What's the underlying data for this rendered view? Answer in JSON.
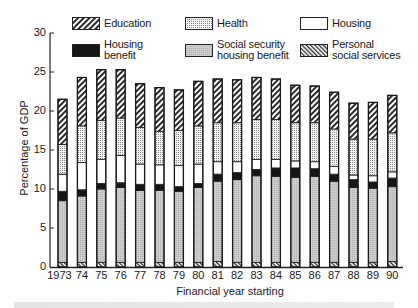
{
  "chart_data": {
    "type": "bar",
    "stacked": true,
    "title": "",
    "xlabel": "Financial year starting",
    "ylabel": "Percentage of GDP",
    "ylim": [
      0,
      30
    ],
    "yticks": [
      0,
      5,
      10,
      15,
      20,
      25,
      30
    ],
    "grid": false,
    "legend_position": "top",
    "categories": [
      "1973",
      "74",
      "75",
      "76",
      "77",
      "78",
      "79",
      "80",
      "81",
      "82",
      "83",
      "84",
      "85",
      "86",
      "87",
      "88",
      "89",
      "90"
    ],
    "series": [
      {
        "name": "Personal social services",
        "pattern": "diag-hatch-right",
        "values": [
          0.6,
          0.6,
          0.6,
          0.6,
          0.6,
          0.6,
          0.6,
          0.6,
          0.7,
          0.6,
          0.6,
          0.6,
          0.6,
          0.6,
          0.6,
          0.6,
          0.6,
          0.7
        ]
      },
      {
        "name": "Social security housing benefit",
        "pattern": "light-gray-stipple",
        "values": [
          7.9,
          8.5,
          9.4,
          9.6,
          9.2,
          9.2,
          9.1,
          9.6,
          10.3,
          10.6,
          11.1,
          11.0,
          10.9,
          11.0,
          10.4,
          9.6,
          9.5,
          9.6
        ]
      },
      {
        "name": "Housing benefit",
        "pattern": "solid-black",
        "values": [
          1.2,
          0.8,
          0.7,
          0.6,
          0.8,
          0.8,
          0.6,
          0.5,
          0.9,
          0.9,
          0.8,
          1.1,
          1.2,
          1.0,
          0.9,
          1.0,
          0.8,
          1.1
        ]
      },
      {
        "name": "Housing",
        "pattern": "white",
        "values": [
          2.2,
          3.5,
          3.1,
          3.5,
          2.6,
          2.5,
          2.7,
          2.5,
          1.6,
          1.4,
          1.3,
          1.1,
          0.9,
          0.9,
          1.0,
          0.6,
          0.8,
          0.8
        ]
      },
      {
        "name": "Health",
        "pattern": "grid-dots",
        "values": [
          3.8,
          4.7,
          5.0,
          4.8,
          4.7,
          4.3,
          4.5,
          4.9,
          5.0,
          5.0,
          5.1,
          5.1,
          4.9,
          5.0,
          4.8,
          4.6,
          4.7,
          5.0
        ]
      },
      {
        "name": "Education",
        "pattern": "diag-hatch-left",
        "values": [
          5.8,
          6.2,
          6.5,
          6.2,
          5.6,
          5.6,
          5.2,
          5.7,
          5.6,
          5.5,
          5.4,
          5.2,
          4.8,
          4.7,
          4.7,
          4.6,
          4.7,
          4.8
        ]
      }
    ],
    "totals": [
      21.5,
      24.3,
      25.3,
      25.3,
      23.5,
      23.0,
      22.7,
      23.8,
      24.1,
      24.0,
      24.3,
      24.1,
      23.3,
      23.2,
      22.4,
      21.0,
      21.1,
      22.0
    ]
  },
  "legend": {
    "row1": [
      {
        "label": "Education",
        "key": "education"
      },
      {
        "label": "Health",
        "key": "health"
      },
      {
        "label": "Housing",
        "key": "housing"
      }
    ],
    "row2": [
      {
        "label_line1": "Housing",
        "label_line2": "benefit",
        "key": "housing-benefit"
      },
      {
        "label_line1": "Social security",
        "label_line2": "housing benefit",
        "key": "sshb"
      },
      {
        "label_line1": "Personal",
        "label_line2": "social services",
        "key": "pss"
      }
    ]
  },
  "axes": {
    "y_ticks": [
      "0",
      "5",
      "10",
      "15",
      "20",
      "25",
      "30"
    ],
    "y_label": "Percentage of GDP",
    "x_label": "Financial year starting"
  },
  "colors": {
    "education_bg": "#ffffff",
    "education_stroke": "#2a2a2a",
    "health_bg": "#f2f2f2",
    "health_dot": "#8a8a8a",
    "housing": "#ffffff",
    "housing_benefit": "#161616",
    "sshb": "#c4c4c4",
    "pss_stroke": "#2a2a2a",
    "outline": "#222222"
  }
}
